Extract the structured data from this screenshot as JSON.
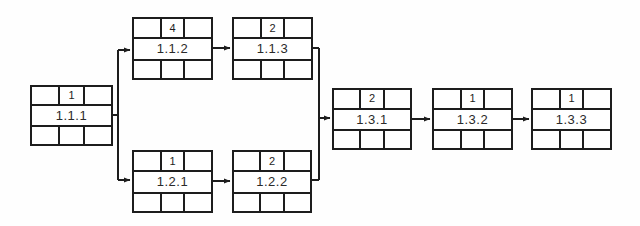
{
  "diagram": {
    "type": "activity-on-node-network",
    "stroke_color": "#1d1d1d",
    "background_color": "#fefefe",
    "nodes": [
      {
        "id": "1.1.1",
        "duration": "1",
        "x": 30,
        "y": 85,
        "w": 83,
        "h": 61
      },
      {
        "id": "1.1.2",
        "duration": "4",
        "x": 132,
        "y": 17,
        "w": 81,
        "h": 63
      },
      {
        "id": "1.1.3",
        "duration": "2",
        "x": 232,
        "y": 17,
        "w": 81,
        "h": 63
      },
      {
        "id": "1.2.1",
        "duration": "1",
        "x": 132,
        "y": 150,
        "w": 81,
        "h": 63
      },
      {
        "id": "1.2.2",
        "duration": "2",
        "x": 232,
        "y": 150,
        "w": 80,
        "h": 63
      },
      {
        "id": "1.3.1",
        "duration": "2",
        "x": 332,
        "y": 88,
        "w": 80,
        "h": 62
      },
      {
        "id": "1.3.2",
        "duration": "1",
        "x": 432,
        "y": 88,
        "w": 81,
        "h": 62
      },
      {
        "id": "1.3.3",
        "duration": "1",
        "x": 531,
        "y": 88,
        "w": 81,
        "h": 62
      }
    ],
    "edges": [
      {
        "from": "1.1.1",
        "to": "1.1.2",
        "kind": "split-up"
      },
      {
        "from": "1.1.1",
        "to": "1.2.1",
        "kind": "split-down"
      },
      {
        "from": "1.1.2",
        "to": "1.1.3",
        "kind": "straight"
      },
      {
        "from": "1.2.1",
        "to": "1.2.2",
        "kind": "straight"
      },
      {
        "from": "1.1.3",
        "to": "1.3.1",
        "kind": "merge-down"
      },
      {
        "from": "1.2.2",
        "to": "1.3.1",
        "kind": "merge-up"
      },
      {
        "from": "1.3.1",
        "to": "1.3.2",
        "kind": "straight"
      },
      {
        "from": "1.3.2",
        "to": "1.3.3",
        "kind": "straight"
      }
    ]
  }
}
